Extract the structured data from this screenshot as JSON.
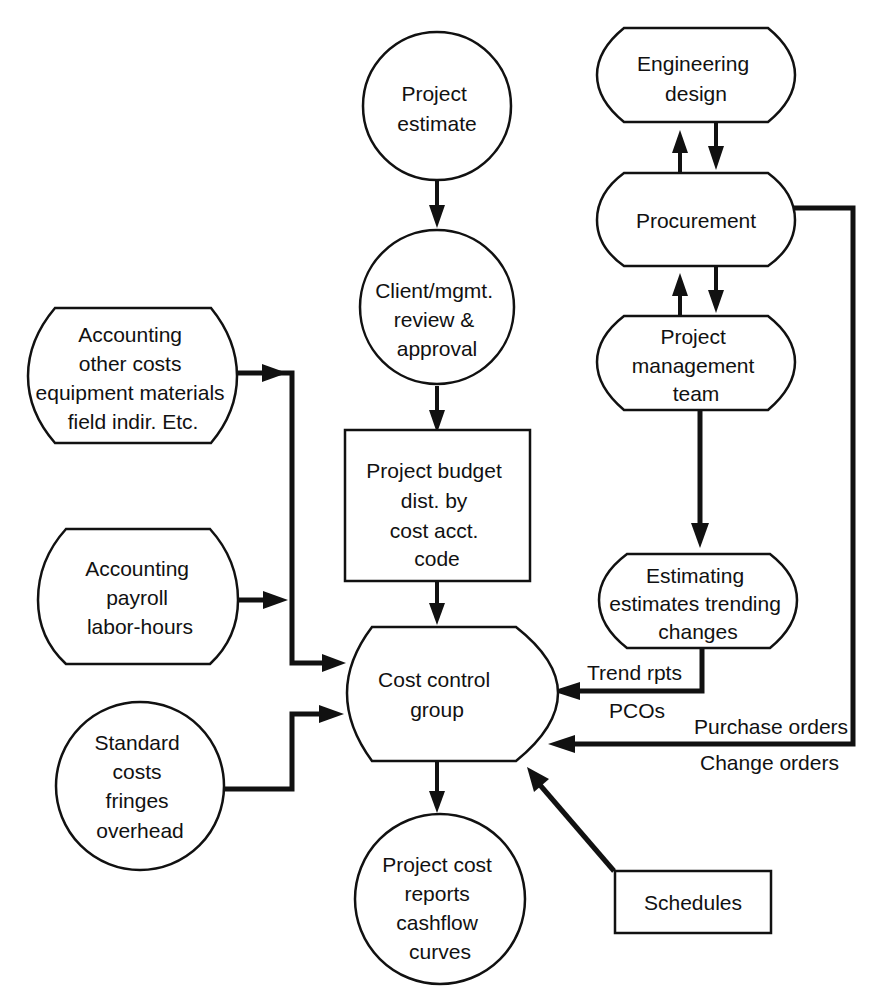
{
  "diagram": {
    "colors": {
      "stroke": "#111111",
      "background": "#ffffff"
    },
    "nodes": {
      "project_estimate": {
        "shape": "circle",
        "lines": [
          "Project",
          "estimate"
        ]
      },
      "client_review": {
        "shape": "circle",
        "lines": [
          "Client/mgmt.",
          "review &",
          "approval"
        ]
      },
      "project_budget": {
        "shape": "rectangle",
        "lines": [
          "Project budget",
          "dist. by",
          "cost  acct.",
          "code"
        ]
      },
      "cost_control": {
        "shape": "terminal",
        "lines": [
          "Cost control",
          "group"
        ]
      },
      "project_cost_reports": {
        "shape": "circle",
        "lines": [
          "Project cost",
          "reports",
          "cashflow",
          "curves"
        ]
      },
      "engineering_design": {
        "shape": "terminal",
        "lines": [
          "Engineering",
          "design"
        ]
      },
      "procurement": {
        "shape": "terminal",
        "lines": [
          "Procurement"
        ]
      },
      "project_mgmt_team": {
        "shape": "terminal",
        "lines": [
          "Project",
          "management",
          "team"
        ]
      },
      "estimating": {
        "shape": "terminal",
        "lines": [
          "Estimating",
          "estimates trending",
          "changes"
        ]
      },
      "accounting_other": {
        "shape": "terminal",
        "lines": [
          "Accounting",
          "other costs",
          "equipment materials",
          "field indir. Etc."
        ]
      },
      "accounting_payroll": {
        "shape": "terminal",
        "lines": [
          "Accounting",
          "payroll",
          "labor-hours"
        ]
      },
      "standard_costs": {
        "shape": "circle",
        "lines": [
          "Standard",
          "costs",
          "fringes",
          "overhead"
        ]
      },
      "schedules": {
        "shape": "rectangle",
        "lines": [
          "Schedules"
        ]
      }
    },
    "edge_labels": {
      "trend_rpts": "Trend rpts",
      "pcos": "PCOs",
      "purchase_orders": "Purchase orders",
      "change_orders": "Change orders"
    },
    "edges": [
      {
        "from": "project_estimate",
        "to": "client_review"
      },
      {
        "from": "client_review",
        "to": "project_budget"
      },
      {
        "from": "project_budget",
        "to": "cost_control"
      },
      {
        "from": "cost_control",
        "to": "project_cost_reports"
      },
      {
        "from": "engineering_design",
        "to": "procurement"
      },
      {
        "from": "procurement",
        "to": "engineering_design"
      },
      {
        "from": "procurement",
        "to": "project_mgmt_team"
      },
      {
        "from": "project_mgmt_team",
        "to": "procurement"
      },
      {
        "from": "project_mgmt_team",
        "to": "estimating"
      },
      {
        "from": "estimating",
        "to": "cost_control",
        "label": "Trend rpts / PCOs"
      },
      {
        "from": "procurement",
        "to": "cost_control",
        "label": "Purchase orders / Change orders"
      },
      {
        "from": "accounting_other",
        "to": "cost_control"
      },
      {
        "from": "accounting_payroll",
        "to": "cost_control"
      },
      {
        "from": "standard_costs",
        "to": "cost_control"
      },
      {
        "from": "schedules",
        "to": "cost_control"
      }
    ]
  }
}
